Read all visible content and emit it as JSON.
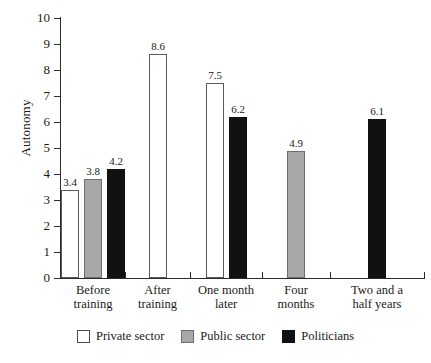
{
  "chart_data": {
    "type": "bar",
    "title": "",
    "xlabel": "",
    "ylabel": "Autonomy",
    "ylim": [
      0,
      10
    ],
    "ytick_labels": [
      "10",
      "9",
      "8",
      "7",
      "6",
      "5",
      "4",
      "3",
      "2",
      "1",
      "0"
    ],
    "yticks": [
      10,
      9,
      8,
      7,
      6,
      5,
      4,
      3,
      2,
      1,
      0
    ],
    "grid": false,
    "legend_position": "bottom",
    "categories": [
      "Before training",
      "After training",
      "One month later",
      "Four months",
      "Two and a half years"
    ],
    "category_lines": [
      [
        "Before",
        "training"
      ],
      [
        "After",
        "training"
      ],
      [
        "One month",
        "later"
      ],
      [
        "Four",
        "months"
      ],
      [
        "Two and a",
        "half years"
      ]
    ],
    "series": [
      {
        "name": "Private sector",
        "color": "#ffffff",
        "values": [
          3.4,
          8.6,
          7.5,
          null,
          null
        ],
        "labels": [
          "3.4",
          "8.6",
          "7.5",
          "",
          ""
        ]
      },
      {
        "name": "Public sector",
        "color": "#a8a8a8",
        "values": [
          3.8,
          null,
          null,
          4.9,
          null
        ],
        "labels": [
          "3.8",
          "",
          "",
          "4.9",
          ""
        ]
      },
      {
        "name": "Politicians",
        "color": "#111111",
        "values": [
          4.2,
          null,
          6.2,
          null,
          6.1
        ],
        "labels": [
          "4.2",
          "",
          "6.2",
          "",
          "6.1"
        ]
      }
    ],
    "bars": [
      {
        "group": "Before training",
        "series": "Private sector",
        "value": 3.4,
        "label": "3.4"
      },
      {
        "group": "Before training",
        "series": "Public sector",
        "value": 3.8,
        "label": "3.8"
      },
      {
        "group": "Before training",
        "series": "Politicians",
        "value": 4.2,
        "label": "4.2"
      },
      {
        "group": "After training",
        "series": "Private sector",
        "value": 8.6,
        "label": "8.6"
      },
      {
        "group": "One month later",
        "series": "Private sector",
        "value": 7.5,
        "label": "7.5"
      },
      {
        "group": "One month later",
        "series": "Politicians",
        "value": 6.2,
        "label": "6.2"
      },
      {
        "group": "Four months",
        "series": "Public sector",
        "value": 4.9,
        "label": "4.9"
      },
      {
        "group": "Two and a half years",
        "series": "Politicians",
        "value": 6.1,
        "label": "6.1"
      }
    ]
  },
  "axis": {
    "y_title": "Autonomy",
    "ticks": [
      {
        "label": "10"
      },
      {
        "label": "9"
      },
      {
        "label": "8"
      },
      {
        "label": "7"
      },
      {
        "label": "6"
      },
      {
        "label": "5"
      },
      {
        "label": "4"
      },
      {
        "label": "3"
      },
      {
        "label": "2"
      },
      {
        "label": "1"
      },
      {
        "label": "0"
      }
    ]
  },
  "legend": {
    "items": [
      {
        "label": "Private sector",
        "swatch": "private"
      },
      {
        "label": "Public sector",
        "swatch": "public"
      },
      {
        "label": "Politicians",
        "swatch": "politicians"
      }
    ]
  }
}
